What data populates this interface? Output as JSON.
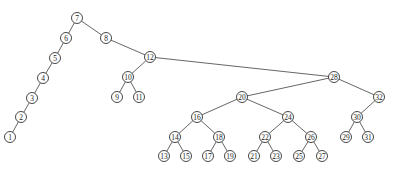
{
  "diagram": {
    "type": "binary-search-tree",
    "node_radius": 5.5,
    "colors": {
      "edge": "#555555",
      "node_stroke": "#333333",
      "node_fill": "#ffffff",
      "label": "#222222"
    },
    "nodes": [
      {
        "id": "7",
        "label": "7",
        "x": 77,
        "y": 18
      },
      {
        "id": "6",
        "label": "6",
        "x": 66,
        "y": 38
      },
      {
        "id": "5",
        "label": "5",
        "x": 55,
        "y": 58
      },
      {
        "id": "4",
        "label": "4",
        "x": 43,
        "y": 78
      },
      {
        "id": "3",
        "label": "3",
        "x": 32,
        "y": 98
      },
      {
        "id": "2",
        "label": "2",
        "x": 21,
        "y": 117
      },
      {
        "id": "1",
        "label": "1",
        "x": 10,
        "y": 137
      },
      {
        "id": "8",
        "label": "8",
        "x": 106,
        "y": 38
      },
      {
        "id": "12",
        "label": "12",
        "x": 150,
        "y": 57
      },
      {
        "id": "10",
        "label": "10",
        "x": 128,
        "y": 77
      },
      {
        "id": "9",
        "label": "9",
        "x": 117,
        "y": 97
      },
      {
        "id": "11",
        "label": "11",
        "x": 139,
        "y": 97
      },
      {
        "id": "28",
        "label": "28",
        "x": 334,
        "y": 77
      },
      {
        "id": "20",
        "label": "20",
        "x": 242,
        "y": 97
      },
      {
        "id": "32",
        "label": "32",
        "x": 379,
        "y": 97
      },
      {
        "id": "16",
        "label": "16",
        "x": 197,
        "y": 117
      },
      {
        "id": "24",
        "label": "24",
        "x": 288,
        "y": 117
      },
      {
        "id": "30",
        "label": "30",
        "x": 357,
        "y": 117
      },
      {
        "id": "14",
        "label": "14",
        "x": 175,
        "y": 137
      },
      {
        "id": "18",
        "label": "18",
        "x": 219,
        "y": 137
      },
      {
        "id": "22",
        "label": "22",
        "x": 265,
        "y": 137
      },
      {
        "id": "26",
        "label": "26",
        "x": 311,
        "y": 137
      },
      {
        "id": "29",
        "label": "29",
        "x": 346,
        "y": 137
      },
      {
        "id": "31",
        "label": "31",
        "x": 368,
        "y": 137
      },
      {
        "id": "13",
        "label": "13",
        "x": 164,
        "y": 156
      },
      {
        "id": "15",
        "label": "15",
        "x": 186,
        "y": 156
      },
      {
        "id": "17",
        "label": "17",
        "x": 208,
        "y": 156
      },
      {
        "id": "19",
        "label": "19",
        "x": 230,
        "y": 156
      },
      {
        "id": "21",
        "label": "21",
        "x": 254,
        "y": 156
      },
      {
        "id": "23",
        "label": "23",
        "x": 276,
        "y": 156
      },
      {
        "id": "25",
        "label": "25",
        "x": 299,
        "y": 156
      },
      {
        "id": "27",
        "label": "27",
        "x": 322,
        "y": 156
      }
    ],
    "edges": [
      [
        "7",
        "6"
      ],
      [
        "6",
        "5"
      ],
      [
        "5",
        "4"
      ],
      [
        "4",
        "3"
      ],
      [
        "3",
        "2"
      ],
      [
        "2",
        "1"
      ],
      [
        "7",
        "8"
      ],
      [
        "8",
        "12"
      ],
      [
        "12",
        "10"
      ],
      [
        "10",
        "9"
      ],
      [
        "10",
        "11"
      ],
      [
        "12",
        "28"
      ],
      [
        "28",
        "20"
      ],
      [
        "28",
        "32"
      ],
      [
        "20",
        "16"
      ],
      [
        "20",
        "24"
      ],
      [
        "16",
        "14"
      ],
      [
        "16",
        "18"
      ],
      [
        "14",
        "13"
      ],
      [
        "14",
        "15"
      ],
      [
        "18",
        "17"
      ],
      [
        "18",
        "19"
      ],
      [
        "24",
        "22"
      ],
      [
        "24",
        "26"
      ],
      [
        "22",
        "21"
      ],
      [
        "22",
        "23"
      ],
      [
        "26",
        "25"
      ],
      [
        "26",
        "27"
      ],
      [
        "32",
        "30"
      ],
      [
        "30",
        "29"
      ],
      [
        "30",
        "31"
      ]
    ]
  }
}
